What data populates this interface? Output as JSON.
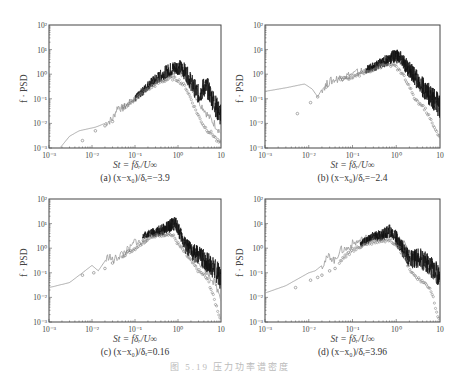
{
  "figure": {
    "caption": "图 5.19  压力功率谱密度",
    "top_cut_text": "",
    "panels_layout": "2x2"
  },
  "panels": [
    {
      "id": "a",
      "caption": "(a) (x−x₀)/δᵣ=−3.9",
      "xlabel": "St = fδᵣ/U∞",
      "ylabel": "f · PSD",
      "left": 49,
      "top": 25,
      "width": 172,
      "height": 123
    },
    {
      "id": "b",
      "caption": "(b) (x−x₀)/δᵣ=−2.4",
      "xlabel": "St = fδᵣ/U∞",
      "ylabel": "f · PSD",
      "left": 265,
      "top": 25,
      "width": 175,
      "height": 123
    },
    {
      "id": "c",
      "caption": "(c) (x−x₀)/δᵣ=0.16",
      "xlabel": "St = fδᵣ/U∞",
      "ylabel": "f · PSD",
      "left": 49,
      "top": 199,
      "width": 172,
      "height": 123
    },
    {
      "id": "d",
      "caption": "(d) (x−x₀)/δᵣ=3.96",
      "xlabel": "St = fδᵣ/U∞",
      "ylabel": "f · PSD",
      "left": 265,
      "top": 199,
      "width": 175,
      "height": 123
    }
  ],
  "chart_data": [
    {
      "type": "line",
      "title": "(a) (x−x₀)/δᵣ=−3.9",
      "xlabel": "St = fδᵣ/U∞",
      "ylabel": "f · PSD",
      "xscale": "log",
      "yscale": "log",
      "xlim": [
        0.001,
        10
      ],
      "ylim": [
        0.001,
        100
      ],
      "xticks": [
        "10⁻³",
        "10⁻²",
        "10⁻¹",
        "10⁰",
        "10"
      ],
      "yticks": [
        "10⁻³",
        "10⁻²",
        "10⁻¹",
        "10⁰",
        "10¹",
        "10²"
      ],
      "grid": false,
      "legend": null,
      "series": [
        {
          "name": "simulation (grey solid)",
          "style": "line",
          "color": "#999999",
          "x": [
            0.0018,
            0.003,
            0.005,
            0.008,
            0.012,
            0.02,
            0.03,
            0.04,
            0.05,
            0.07,
            0.1,
            0.15,
            0.2,
            0.3,
            0.5,
            0.8,
            1.0,
            1.3,
            1.6,
            2,
            2.5,
            3,
            4,
            5,
            7,
            10
          ],
          "y": [
            0.001,
            0.003,
            0.005,
            0.006,
            0.007,
            0.01,
            0.015,
            0.05,
            0.04,
            0.06,
            0.1,
            0.2,
            0.3,
            0.5,
            0.8,
            1.2,
            1.5,
            1.0,
            0.6,
            0.3,
            0.15,
            0.08,
            0.04,
            0.02,
            0.01,
            0.004
          ]
        },
        {
          "name": "experiment (black dense)",
          "style": "band",
          "color": "#111111",
          "x": [
            0.1,
            0.15,
            0.2,
            0.3,
            0.5,
            0.8,
            1.0,
            1.3,
            1.6,
            2,
            2.5,
            3,
            3.5,
            4,
            5,
            6,
            7,
            8,
            10
          ],
          "y": [
            0.1,
            0.2,
            0.35,
            0.6,
            1.2,
            1.8,
            2.0,
            1.6,
            1.0,
            0.5,
            0.25,
            0.15,
            0.2,
            0.3,
            0.25,
            0.12,
            0.07,
            0.04,
            0.02
          ]
        },
        {
          "name": "symbols (open circles)",
          "style": "scatter",
          "color": "#777777",
          "x": [
            0.006,
            0.012,
            0.02,
            0.03,
            0.05,
            0.1,
            0.2,
            0.4,
            0.7,
            1.0,
            1.5,
            2,
            2.5,
            3,
            4,
            5,
            6,
            7,
            8,
            10
          ],
          "y": [
            0.002,
            0.005,
            0.008,
            0.012,
            0.04,
            0.1,
            0.25,
            0.5,
            0.7,
            0.6,
            0.3,
            0.1,
            0.04,
            0.02,
            0.008,
            0.005,
            0.004,
            0.003,
            0.002,
            0.0015
          ]
        }
      ]
    },
    {
      "type": "line",
      "title": "(b) (x−x₀)/δᵣ=−2.4",
      "xlabel": "St = fδᵣ/U∞",
      "ylabel": "f · PSD",
      "xscale": "log",
      "yscale": "log",
      "xlim": [
        0.001,
        10
      ],
      "ylim": [
        0.001,
        100
      ],
      "xticks": [
        "10⁻³",
        "10⁻²",
        "10⁻¹",
        "10⁰",
        "10"
      ],
      "yticks": [
        "10⁻³",
        "10⁻²",
        "10⁻¹",
        "10⁰",
        "10¹",
        "10²"
      ],
      "grid": false,
      "legend": null,
      "series": [
        {
          "name": "simulation (grey solid)",
          "style": "line",
          "color": "#999999",
          "x": [
            0.001,
            0.003,
            0.008,
            0.012,
            0.016,
            0.02,
            0.03,
            0.05,
            0.08,
            0.1,
            0.2,
            0.3,
            0.5,
            0.8,
            1.0,
            1.3,
            2,
            3,
            5,
            7,
            10
          ],
          "y": [
            0.2,
            0.28,
            0.4,
            0.25,
            0.12,
            0.25,
            0.5,
            0.7,
            0.9,
            1.0,
            1.5,
            2,
            2.5,
            3.5,
            4,
            3,
            1.5,
            0.6,
            0.2,
            0.08,
            0.03
          ]
        },
        {
          "name": "experiment (black dense)",
          "style": "band",
          "color": "#111111",
          "x": [
            0.2,
            0.3,
            0.5,
            0.8,
            1.0,
            1.3,
            1.6,
            2,
            3,
            4,
            5,
            7,
            10
          ],
          "y": [
            1.5,
            2,
            3,
            5,
            6,
            4,
            2.5,
            1.5,
            0.6,
            0.3,
            0.2,
            0.1,
            0.05
          ]
        },
        {
          "name": "symbols (open circles)",
          "style": "scatter",
          "color": "#777777",
          "x": [
            0.0055,
            0.011,
            0.016,
            0.025,
            0.05,
            0.1,
            0.2,
            0.4,
            0.7,
            1.0,
            1.5,
            2,
            2.5,
            3,
            4,
            5,
            6,
            7,
            8,
            10
          ],
          "y": [
            0.025,
            0.07,
            0.12,
            0.3,
            0.6,
            0.8,
            1.2,
            2,
            2.5,
            2.0,
            0.8,
            0.3,
            0.12,
            0.08,
            0.05,
            0.03,
            0.015,
            0.008,
            0.005,
            0.003
          ]
        }
      ]
    },
    {
      "type": "line",
      "title": "(c) (x−x₀)/δᵣ=0.16",
      "xlabel": "St = fδᵣ/U∞",
      "ylabel": "f · PSD",
      "xscale": "log",
      "yscale": "log",
      "xlim": [
        0.001,
        10
      ],
      "ylim": [
        0.001,
        100
      ],
      "xticks": [
        "10⁻³",
        "10⁻²",
        "10⁻¹",
        "10⁰",
        "10"
      ],
      "yticks": [
        "10⁻³",
        "10⁻²",
        "10⁻¹",
        "10⁰",
        "10¹",
        "10²"
      ],
      "grid": false,
      "legend": null,
      "series": [
        {
          "name": "simulation (grey solid)",
          "style": "line",
          "color": "#999999",
          "x": [
            0.001,
            0.003,
            0.006,
            0.01,
            0.014,
            0.02,
            0.025,
            0.03,
            0.05,
            0.08,
            0.1,
            0.15,
            0.2,
            0.3,
            0.5,
            0.8,
            1.0,
            1.5,
            2,
            3,
            5,
            7,
            10
          ],
          "y": [
            0.025,
            0.04,
            0.1,
            0.2,
            0.12,
            0.3,
            0.5,
            0.3,
            0.6,
            1.0,
            2,
            1.5,
            3,
            4,
            5,
            7,
            5,
            2,
            0.8,
            0.3,
            0.1,
            0.04,
            0.01
          ]
        },
        {
          "name": "experiment (black dense)",
          "style": "band",
          "color": "#111111",
          "x": [
            0.15,
            0.2,
            0.3,
            0.5,
            0.7,
            0.9,
            1.2,
            1.5,
            2,
            3,
            4,
            5,
            7,
            10
          ],
          "y": [
            3,
            4,
            4.5,
            6,
            9,
            10,
            3,
            1.2,
            0.8,
            0.5,
            0.35,
            0.25,
            0.15,
            0.06
          ]
        },
        {
          "name": "symbols (open circles)",
          "style": "scatter",
          "color": "#777777",
          "x": [
            0.006,
            0.011,
            0.02,
            0.03,
            0.05,
            0.1,
            0.2,
            0.4,
            0.6,
            0.8,
            1.0,
            1.5,
            2,
            3,
            4,
            5,
            6,
            7,
            8,
            9,
            10
          ],
          "y": [
            0.08,
            0.1,
            0.15,
            0.25,
            0.5,
            1.0,
            2.5,
            3.5,
            4,
            3,
            1.5,
            0.6,
            0.3,
            0.12,
            0.08,
            0.05,
            0.02,
            0.008,
            0.004,
            0.002,
            0.001
          ]
        }
      ]
    },
    {
      "type": "line",
      "title": "(d) (x−x₀)/δᵣ=3.96",
      "xlabel": "St = fδᵣ/U∞",
      "ylabel": "f · PSD",
      "xscale": "log",
      "yscale": "log",
      "xlim": [
        0.001,
        10
      ],
      "ylim": [
        0.001,
        100
      ],
      "xticks": [
        "10⁻³",
        "10⁻²",
        "10⁻¹",
        "10⁰",
        "10"
      ],
      "yticks": [
        "10⁻³",
        "10⁻²",
        "10⁻¹",
        "10⁰",
        "10¹",
        "10²"
      ],
      "grid": false,
      "legend": null,
      "series": [
        {
          "name": "simulation (grey solid)",
          "style": "line",
          "color": "#999999",
          "x": [
            0.001,
            0.003,
            0.006,
            0.01,
            0.014,
            0.02,
            0.03,
            0.04,
            0.05,
            0.08,
            0.1,
            0.15,
            0.2,
            0.3,
            0.5,
            0.8,
            1.0,
            1.5,
            2,
            3,
            5,
            7,
            10
          ],
          "y": [
            0.015,
            0.03,
            0.06,
            0.1,
            0.12,
            0.2,
            0.5,
            0.3,
            0.8,
            1.0,
            1.5,
            2,
            2.5,
            3,
            3.5,
            4,
            3,
            1.5,
            0.6,
            0.3,
            0.15,
            0.08,
            0.03
          ]
        },
        {
          "name": "experiment (black dense)",
          "style": "band",
          "color": "#111111",
          "x": [
            0.15,
            0.2,
            0.3,
            0.5,
            0.7,
            0.9,
            1.2,
            1.5,
            2,
            3,
            3.5,
            4,
            5,
            7,
            10
          ],
          "y": [
            1.5,
            2,
            3,
            3.5,
            5,
            3.5,
            1.5,
            0.8,
            0.35,
            0.4,
            0.45,
            0.3,
            0.25,
            0.15,
            0.07
          ]
        },
        {
          "name": "symbols (open circles)",
          "style": "scatter",
          "color": "#777777",
          "x": [
            0.005,
            0.011,
            0.016,
            0.02,
            0.03,
            0.04,
            0.06,
            0.1,
            0.2,
            0.4,
            0.7,
            1.0,
            1.5,
            2,
            3,
            4,
            5,
            6,
            7,
            8,
            10
          ],
          "y": [
            0.025,
            0.05,
            0.065,
            0.08,
            0.12,
            0.15,
            0.4,
            0.8,
            1.5,
            2,
            2.2,
            1.5,
            0.5,
            0.15,
            0.06,
            0.04,
            0.03,
            0.025,
            0.01,
            0.003,
            0.001
          ]
        }
      ]
    }
  ]
}
